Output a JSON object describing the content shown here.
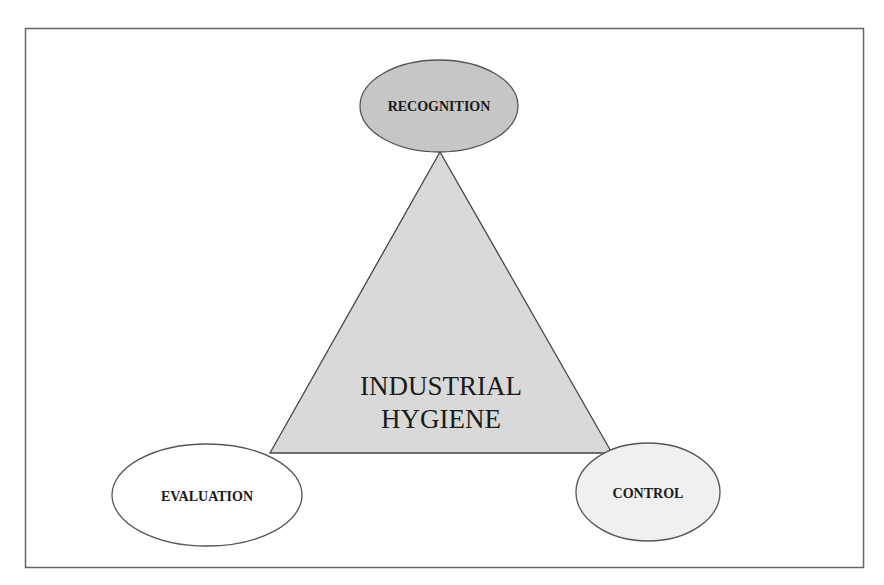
{
  "diagram": {
    "center": {
      "line1": "INDUSTRIAL",
      "line2": "HYGIENE"
    },
    "nodes": {
      "top": {
        "label": "RECOGNITION",
        "fill": "#c6c6c6"
      },
      "left": {
        "label": "EVALUATION",
        "fill": "#ffffff"
      },
      "right": {
        "label": "CONTROL",
        "fill": "#f0f0f0"
      }
    },
    "colors": {
      "triangle_fill": "#d9d9d9",
      "stroke": "#555555",
      "frame": "#666666"
    }
  }
}
